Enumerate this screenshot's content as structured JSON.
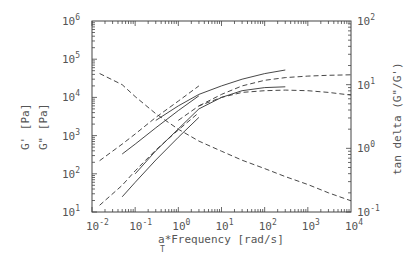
{
  "chart_data": {
    "type": "line",
    "title": "",
    "xlabel": "a_T*Frequency [rad/s]",
    "xlabel_parts": {
      "prefix": "a",
      "subscript": "T",
      "suffix": "*Frequency  [rad/s]"
    },
    "ylabel_left": [
      "G'  [Pa]",
      "G\"  [Pa]"
    ],
    "ylabel_right": "tan delta  (G\"/G')",
    "xscale": "log",
    "yscale_left": "log",
    "yscale_right": "log",
    "xlim": [
      0.01,
      10000
    ],
    "ylim_left": [
      10,
      1000000
    ],
    "ylim_right": [
      0.1,
      100
    ],
    "x_ticks": [
      "-2",
      "-1",
      "0",
      "1",
      "2",
      "3",
      "4"
    ],
    "y_ticks_left": [
      "1",
      "2",
      "3",
      "4",
      "5",
      "6"
    ],
    "y_ticks_right": [
      "-1",
      "0",
      "1",
      "2"
    ],
    "grid": false,
    "legend": null,
    "values_note": "Series values are approximate, estimated by pixel-tracing curves on log axes; not read from labels.",
    "series": [
      {
        "name": "G' (dashed, low)",
        "axis": "left",
        "style": "dashed",
        "x": [
          0.015,
          0.05,
          0.1,
          0.3,
          1,
          3
        ],
        "y": [
          15,
          50,
          120,
          420,
          1400,
          4000
        ]
      },
      {
        "name": "G' (solid 1)",
        "axis": "left",
        "style": "solid",
        "x": [
          0.05,
          0.1,
          0.3,
          1,
          3
        ],
        "y": [
          25,
          60,
          230,
          900,
          3000
        ]
      },
      {
        "name": "G' (solid 2)",
        "axis": "left",
        "style": "solid",
        "x": [
          0.1,
          0.3,
          1,
          3,
          10,
          30,
          100,
          300
        ],
        "y": [
          100,
          400,
          1500,
          5000,
          10000,
          15000,
          18000,
          19000
        ]
      },
      {
        "name": "G' (dashed, high)",
        "axis": "left",
        "style": "dashed",
        "x": [
          1,
          3,
          10,
          30,
          100,
          300,
          1000,
          3000,
          10000
        ],
        "y": [
          2500,
          6000,
          10000,
          13500,
          15000,
          15500,
          15000,
          13500,
          11500
        ]
      },
      {
        "name": "G'' (dashed)",
        "axis": "left",
        "style": "dashed",
        "x": [
          0.015,
          0.05,
          0.1,
          0.3,
          1,
          3
        ],
        "y": [
          220,
          600,
          1100,
          3000,
          8000,
          20000
        ]
      },
      {
        "name": "G'' (solid 1)",
        "axis": "left",
        "style": "solid",
        "x": [
          0.05,
          0.1,
          0.3,
          1,
          3
        ],
        "y": [
          330,
          600,
          1600,
          4500,
          11000
        ]
      },
      {
        "name": "G'' (solid 2)",
        "axis": "left",
        "style": "solid",
        "x": [
          0.3,
          1,
          3,
          10,
          30,
          100,
          300
        ],
        "y": [
          2500,
          6000,
          12000,
          20000,
          30000,
          42000,
          52000
        ]
      },
      {
        "name": "G'' (dashed 2)",
        "axis": "left",
        "style": "dashed",
        "x": [
          3,
          10,
          30,
          100,
          300,
          1000,
          3000,
          10000
        ],
        "y": [
          6000,
          12000,
          20000,
          28000,
          33000,
          36000,
          38000,
          39000
        ]
      },
      {
        "name": "tan delta",
        "axis": "right",
        "style": "dashed",
        "x": [
          0.015,
          0.05,
          0.1,
          0.3,
          1,
          3,
          10,
          30,
          100,
          300,
          1000,
          3000,
          10000
        ],
        "y": [
          15,
          10,
          6.5,
          3.5,
          2.0,
          1.3,
          0.9,
          0.65,
          0.48,
          0.36,
          0.27,
          0.2,
          0.15
        ]
      }
    ]
  }
}
